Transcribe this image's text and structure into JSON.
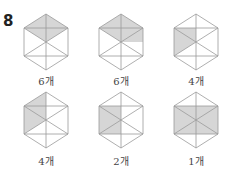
{
  "question": {
    "number": "8",
    "top_cut_text": "~ ~ ~ ~ ~"
  },
  "colors": {
    "shade": "#d6d6d6",
    "line": "#9a9a9a"
  },
  "figures": [
    {
      "label": "6개",
      "shade": "top-rhombus"
    },
    {
      "label": "6개",
      "shade": "top-right-parallelogram"
    },
    {
      "label": "4개",
      "shade": "left-triangle"
    },
    {
      "label": "4개",
      "shade": "left-trapezoid"
    },
    {
      "label": "2개",
      "shade": "left-half-rectangle"
    },
    {
      "label": "1개",
      "shade": "inner-rectangle"
    }
  ]
}
